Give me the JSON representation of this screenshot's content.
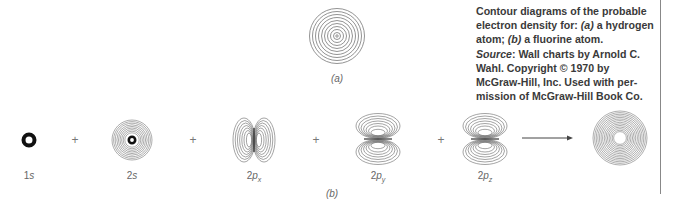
{
  "caption": {
    "line1": "Contour diagrams of the probable",
    "line2": "electron density for: ",
    "part_a_marker": "(a)",
    "line2_rest": " a hydrogen",
    "line3_prefix": "atom; ",
    "part_b_marker": "(b)",
    "line3_rest": " a fluorine atom.",
    "source_label": "Source",
    "source_rest": ": Wall charts by Arnold C.",
    "line5": "Wahl. Copyright © 1970 by",
    "line6": "McGraw-Hill, Inc. Used with per-",
    "line7": "mission of McGraw-Hill Book Co."
  },
  "panel_a": {
    "label": "(a)",
    "description": "hydrogen atom electron density contours"
  },
  "panel_b": {
    "label": "(b)",
    "description": "fluorine atom: orbital contributions summed",
    "operator": "+",
    "orbitals": [
      {
        "main": "1",
        "letter": "s",
        "sub": ""
      },
      {
        "main": "2",
        "letter": "s",
        "sub": ""
      },
      {
        "main": "2",
        "letter": "p",
        "sub": "x"
      },
      {
        "main": "2",
        "letter": "p",
        "sub": "y"
      },
      {
        "main": "2",
        "letter": "p",
        "sub": "z"
      }
    ],
    "result": "fluorine atom total density"
  }
}
